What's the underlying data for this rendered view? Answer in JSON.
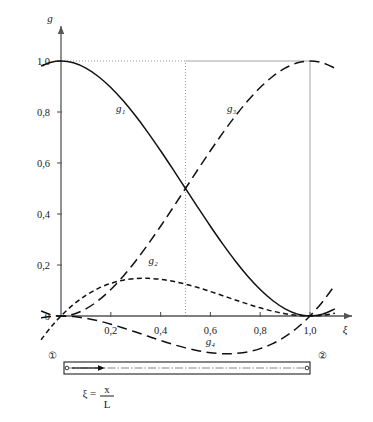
{
  "figure": {
    "y_axis_label": "g",
    "x_axis_label": "ξ",
    "y_ticks": [
      "0",
      "0,2",
      "0,4",
      "0,6",
      "0,8",
      "1,0"
    ],
    "x_ticks": [
      "0,2",
      "0,4",
      "0,6",
      "0,8",
      "1,0"
    ],
    "curve_labels": {
      "g1": "g₁",
      "g2": "g₂",
      "g3": "g₃",
      "g4": "g₄"
    },
    "beam": {
      "node_left": "①",
      "node_right": "②",
      "formula_var": "ξ",
      "formula_eq": "=",
      "formula_num": "x",
      "formula_den": "L"
    },
    "colors": {
      "axis": "#555555",
      "curve": "#111111",
      "guide": "#999999"
    }
  },
  "chart_data": {
    "type": "line",
    "title": "",
    "xlabel": "ξ",
    "ylabel": "g",
    "xlim": [
      -0.08,
      1.12
    ],
    "ylim": [
      -0.22,
      1.1
    ],
    "xticks": [
      0.2,
      0.4,
      0.6,
      0.8,
      1.0
    ],
    "xticklabels": [
      "0,2",
      "0,4",
      "0,6",
      "0,8",
      "1,0"
    ],
    "yticks": [
      0,
      0.2,
      0.4,
      0.6,
      0.8,
      1.0
    ],
    "yticklabels": [
      "0",
      "0,2",
      "0,4",
      "0,6",
      "0,8",
      "1,0"
    ],
    "grid": false,
    "guides": [
      {
        "type": "hline",
        "y": 1.0,
        "x_from": 0.0,
        "x_to": 0.5,
        "style": "dotted"
      },
      {
        "type": "hline",
        "y": 1.0,
        "x_from": 0.5,
        "x_to": 1.0,
        "style": "solid"
      },
      {
        "type": "vline",
        "x": 0.5,
        "y_from": 0.0,
        "y_to": 1.0,
        "style": "dotted"
      },
      {
        "type": "vline",
        "x": 1.0,
        "y_from": 0.0,
        "y_to": 1.0,
        "style": "solid"
      }
    ],
    "legend": "inline-labels",
    "series": [
      {
        "name": "g₁",
        "formula": "1 - 3ξ² + 2ξ³",
        "style": "solid",
        "label_at": [
          0.24,
          0.8
        ],
        "x": [
          -0.08,
          -0.04,
          0.0,
          0.05,
          0.1,
          0.15,
          0.2,
          0.25,
          0.3,
          0.35,
          0.4,
          0.45,
          0.5,
          0.55,
          0.6,
          0.65,
          0.7,
          0.75,
          0.8,
          0.85,
          0.9,
          0.95,
          1.0,
          1.05,
          1.1
        ],
        "y": [
          0.9803,
          0.9952,
          1.0,
          0.9928,
          0.972,
          0.9393,
          0.896,
          0.8438,
          0.784,
          0.7183,
          0.648,
          0.5748,
          0.5,
          0.4253,
          0.352,
          0.2818,
          0.216,
          0.1563,
          0.104,
          0.0608,
          0.028,
          0.0073,
          0.0,
          0.0073,
          0.028
        ]
      },
      {
        "name": "g₂",
        "formula": "ξ(1 - ξ)²",
        "style": "dashed-short",
        "label_at": [
          0.37,
          0.205
        ],
        "x": [
          -0.08,
          -0.04,
          0.0,
          0.05,
          0.1,
          0.15,
          0.2,
          0.25,
          0.3,
          0.3333,
          0.35,
          0.4,
          0.45,
          0.5,
          0.55,
          0.6,
          0.65,
          0.7,
          0.75,
          0.8,
          0.85,
          0.9,
          0.95,
          1.0,
          1.05,
          1.1
        ],
        "y": [
          -0.0933,
          -0.0433,
          0.0,
          0.0451,
          0.081,
          0.1084,
          0.128,
          0.1406,
          0.147,
          0.1481,
          0.1479,
          0.144,
          0.1361,
          0.125,
          0.1114,
          0.096,
          0.0796,
          0.063,
          0.0469,
          0.032,
          0.0191,
          0.009,
          0.0024,
          0.0,
          0.0026,
          0.011
        ]
      },
      {
        "name": "g₃",
        "formula": "3ξ² - 2ξ³",
        "style": "dashed-long",
        "label_at": [
          0.685,
          0.8
        ],
        "x": [
          -0.08,
          -0.04,
          0.0,
          0.05,
          0.1,
          0.15,
          0.2,
          0.25,
          0.3,
          0.35,
          0.4,
          0.45,
          0.5,
          0.55,
          0.6,
          0.65,
          0.7,
          0.75,
          0.8,
          0.85,
          0.9,
          0.95,
          1.0,
          1.05,
          1.1
        ],
        "y": [
          0.0197,
          0.0048,
          0.0,
          0.0072,
          0.028,
          0.0607,
          0.104,
          0.1563,
          0.216,
          0.2818,
          0.352,
          0.4253,
          0.5,
          0.5748,
          0.648,
          0.7183,
          0.784,
          0.8438,
          0.896,
          0.9393,
          0.972,
          0.9928,
          1.0,
          0.9928,
          0.972
        ]
      },
      {
        "name": "g₄",
        "formula": "-ξ²(1 - ξ)",
        "style": "dashed-long",
        "label_at": [
          0.6,
          -0.115
        ],
        "x": [
          -0.08,
          -0.04,
          0.0,
          0.05,
          0.1,
          0.15,
          0.2,
          0.25,
          0.3,
          0.35,
          0.4,
          0.45,
          0.5,
          0.55,
          0.6,
          0.65,
          0.6667,
          0.7,
          0.75,
          0.8,
          0.85,
          0.9,
          0.95,
          1.0,
          1.05,
          1.1
        ],
        "y": [
          -0.0069,
          -0.0017,
          0.0,
          -0.0024,
          -0.009,
          -0.0191,
          -0.032,
          -0.0469,
          -0.063,
          -0.0796,
          -0.096,
          -0.1114,
          -0.125,
          -0.1361,
          -0.144,
          -0.1479,
          -0.1481,
          -0.147,
          -0.1406,
          -0.128,
          -0.1084,
          -0.081,
          -0.0451,
          0.0,
          0.0551,
          0.121
        ]
      }
    ]
  }
}
